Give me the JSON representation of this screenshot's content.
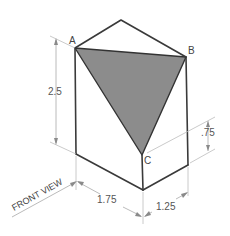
{
  "diagram": {
    "type": "isometric-prism-drawing",
    "points": {
      "a": "A",
      "b": "B",
      "c": "C"
    },
    "dimensions": {
      "height": "2.5",
      "front_width": "1.75",
      "side_depth": "1.25",
      "c_offset": ".75"
    },
    "view_label": "FRONT VIEW",
    "colors": {
      "edge": "#3a3a3a",
      "shaded_triangle": "#8c8c8c",
      "dimension_line": "#a8a8a8"
    }
  }
}
